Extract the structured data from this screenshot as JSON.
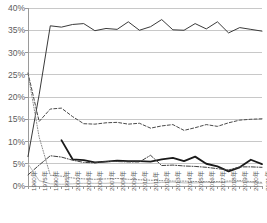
{
  "chart_data": {
    "type": "line",
    "title": "",
    "xlabel": "",
    "ylabel": "",
    "ylim": [
      0,
      40
    ],
    "yticks": [
      0,
      5,
      10,
      15,
      20,
      25,
      30,
      35,
      40
    ],
    "ytick_labels": [
      "0%",
      "5%",
      "10%",
      "15%",
      "20%",
      "25%",
      "30%",
      "35%",
      "40%"
    ],
    "grid": true,
    "legend": "none",
    "categories": [
      "1960年",
      "1975年",
      "1990年",
      "1995年",
      "2000年",
      "2005年",
      "2006年",
      "2007年",
      "2008年",
      "2009年",
      "2010年",
      "2011年",
      "2012年",
      "2013年",
      "2014年",
      "2015年",
      "2016年",
      "2017年",
      "2018年",
      "2019年",
      "2020年",
      "2021年"
    ],
    "series": [
      {
        "name": "series-1-solid-thin",
        "style": "solid",
        "color": "#3a3a3a",
        "width": 1.0,
        "values": [
          6.6,
          20.5,
          36.0,
          35.7,
          36.3,
          36.5,
          34.9,
          35.4,
          35.2,
          36.9,
          35.0,
          35.8,
          37.4,
          35.1,
          35.0,
          36.5,
          35.3,
          36.9,
          34.4,
          35.6,
          35.2,
          34.8
        ]
      },
      {
        "name": "series-2-dashed",
        "style": "dashed",
        "color": "#4a4a4a",
        "width": 1.0,
        "values": [
          25.4,
          14.5,
          17.3,
          17.5,
          15.6,
          14.0,
          13.9,
          14.2,
          14.3,
          13.9,
          14.1,
          13.0,
          13.5,
          13.8,
          12.5,
          13.1,
          13.8,
          13.4,
          14.2,
          14.8,
          15.0,
          15.1
        ]
      },
      {
        "name": "series-3-solid-bold",
        "style": "solid",
        "color": "#1a1a1a",
        "width": 1.8,
        "values": [
          null,
          null,
          null,
          10.3,
          6.0,
          5.8,
          5.3,
          5.5,
          5.7,
          5.6,
          5.6,
          5.5,
          6.0,
          6.3,
          5.6,
          6.6,
          5.0,
          4.4,
          3.3,
          4.2,
          5.9,
          4.9
        ]
      },
      {
        "name": "series-4-dash-dot",
        "style": "dashdot",
        "color": "#3f3f3f",
        "width": 1.0,
        "values": [
          2.5,
          4.7,
          6.8,
          6.5,
          5.8,
          5.3,
          5.2,
          5.5,
          5.5,
          5.4,
          5.4,
          6.9,
          4.6,
          4.7,
          4.5,
          4.4,
          4.2,
          3.9,
          3.6,
          4.3,
          4.3,
          4.2
        ]
      },
      {
        "name": "series-5-dotted",
        "style": "dotted",
        "color": "#8c8c8c",
        "width": 1.0,
        "values": [
          25.2,
          11.0,
          2.4,
          2.2,
          1.8,
          1.6,
          1.5,
          1.6,
          1.7,
          1.5,
          1.4,
          1.3,
          1.2,
          1.1,
          1.1,
          1.0,
          1.0,
          1.0,
          1.1,
          1.2,
          1.0,
          0.8
        ]
      },
      {
        "name": "series-6-solid-gray",
        "style": "solid",
        "color": "#bdbdbd",
        "width": 1.0,
        "values": [
          5.0,
          1.2,
          0.5,
          0.4,
          0.5,
          0.6,
          0.6,
          0.6,
          0.7,
          0.6,
          0.6,
          0.6,
          0.8,
          0.9,
          0.7,
          0.7,
          0.8,
          0.8,
          0.9,
          1.0,
          0.8,
          0.6
        ]
      }
    ]
  },
  "axis": {
    "grid_color": "#c8c8c8",
    "axis_color": "#9a9a9a",
    "tick_color": "#9a9a9a",
    "label_color": "#5c5c5c"
  },
  "plot": {
    "left": 28,
    "right": 262,
    "top": 8,
    "bottom": 186
  }
}
